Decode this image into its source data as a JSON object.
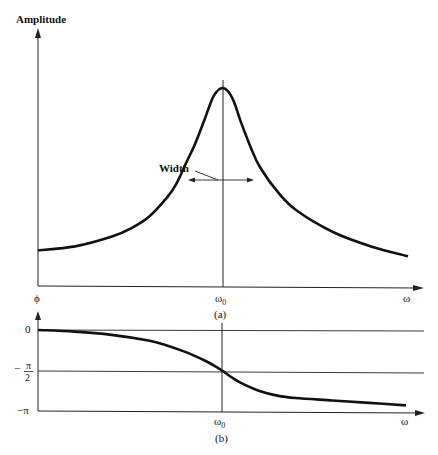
{
  "chart_data": [
    {
      "type": "line",
      "panel": "(a)",
      "title": "",
      "ylabel": "Amplitude",
      "xlabel": "ω",
      "x_ticks": [
        "ω0"
      ],
      "annotation": "Width",
      "curve": "resonance (Lorentzian-like) amplitude peaked at ω0",
      "x": [
        0,
        0.2,
        0.4,
        0.5,
        0.6,
        0.7,
        0.75,
        0.8,
        0.85,
        0.9,
        0.95,
        1.0,
        1.05,
        1.1,
        1.15,
        1.2,
        1.3,
        1.4,
        1.6,
        1.8,
        2.0,
        2.2,
        2.4,
        2.6
      ],
      "values": [
        0.18,
        0.2,
        0.25,
        0.29,
        0.35,
        0.45,
        0.52,
        0.62,
        0.72,
        0.84,
        0.96,
        1.0,
        0.95,
        0.82,
        0.7,
        0.6,
        0.47,
        0.38,
        0.27,
        0.2,
        0.15,
        0.11,
        0.08,
        0.05
      ],
      "xlim": [
        0,
        2.75
      ],
      "ylim": [
        0,
        1.1
      ]
    },
    {
      "type": "line",
      "panel": "(b)",
      "ylabel": "ϕ",
      "xlabel": "ω",
      "x_ticks": [
        "ω0"
      ],
      "y_ticks": [
        "0",
        "−π/2",
        "−π"
      ],
      "curve": "phase lag, passing −π/2 at ω0",
      "x": [
        0,
        0.2,
        0.4,
        0.6,
        0.7,
        0.8,
        0.9,
        0.95,
        1.0,
        1.05,
        1.1,
        1.2,
        1.3,
        1.4,
        1.6,
        1.8,
        2.0,
        2.2,
        2.4,
        2.6
      ],
      "values": [
        0,
        -0.02,
        -0.06,
        -0.13,
        -0.19,
        -0.27,
        -0.37,
        -0.43,
        -0.5,
        -0.58,
        -0.65,
        -0.75,
        -0.81,
        -0.84,
        -0.87,
        -0.9,
        -0.93,
        -0.95,
        -0.97,
        -0.99
      ],
      "values_unit": "multiples of π",
      "xlim": [
        0,
        2.75
      ],
      "ylim": [
        -1,
        0
      ]
    }
  ],
  "labels": {
    "amplitude": "Amplitude",
    "width": "Width",
    "omega0_a": "ω",
    "omega0_sub": "0",
    "omega_a": "ω",
    "panel_a": "(a)",
    "phi": "ϕ",
    "zero": "0",
    "minus": "−",
    "pi": "π",
    "two": "2",
    "minus_pi": "−π",
    "omega0_b": "ω",
    "omega_b": "ω",
    "panel_b": "(b)"
  }
}
